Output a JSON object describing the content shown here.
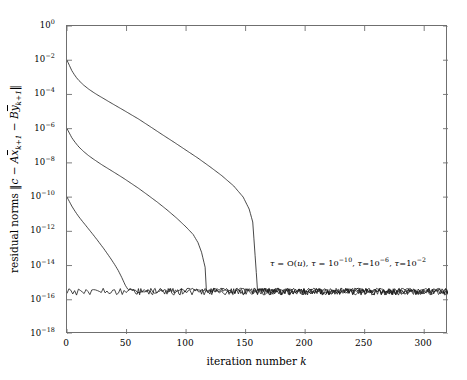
{
  "chart_data": {
    "type": "line",
    "title": "",
    "xlabel": "iteration number k",
    "ylabel": "residual norms ||c - A x̄_{k+1} - B ȳ_{k+1}||",
    "xscale": "linear",
    "yscale": "log",
    "xlim": [
      0,
      320
    ],
    "ylim": [
      1e-18,
      1.0
    ],
    "grid": false,
    "legend_position": "inline-annotation",
    "xticks": [
      0,
      50,
      100,
      150,
      200,
      250,
      300
    ],
    "xticklabels": [
      "0",
      "50",
      "100",
      "150",
      "200",
      "250",
      "300"
    ],
    "yticks": [
      1.0,
      0.01,
      0.0001,
      1e-06,
      1e-08,
      1e-10,
      1e-12,
      1e-14,
      1e-16,
      1e-18
    ],
    "yticklabel_mantissa": "10",
    "yticklabel_exponents": [
      "0",
      "-2",
      "-4",
      "-6",
      "-8",
      "-10",
      "-12",
      "-14",
      "-16",
      "-18"
    ],
    "line_color": "#1a1a1a",
    "line_width": 0.8,
    "noise_floor": 3e-16,
    "annotation": {
      "text": "τ = O(u),  τ = 10^{-10},  τ=10^{-6},  τ=10^{-2}",
      "parts": [
        {
          "tau": "τ",
          "eq": " = O(",
          "var": "u",
          "tail": "),"
        },
        {
          "tau": "τ",
          "eq": " = 10",
          "exp": "-10",
          "tail": ","
        },
        {
          "tau": "τ",
          "eq": "=10",
          "exp": "-6",
          "tail": ","
        },
        {
          "tau": "τ",
          "eq": "=10",
          "exp": "-2",
          "tail": ""
        }
      ],
      "x_data": 205,
      "y_data": 2e-15
    },
    "series": [
      {
        "name": "tau = 10^-2",
        "label": "τ=10⁻²",
        "start_value": 0.01,
        "converge_iteration": 155,
        "points_x": [
          0,
          2,
          4,
          6,
          8,
          10,
          14,
          18,
          22,
          26,
          30,
          36,
          42,
          48,
          54,
          60,
          70,
          80,
          90,
          100,
          110,
          120,
          130,
          140,
          148,
          153,
          156,
          160,
          170,
          185,
          200,
          220,
          240,
          260,
          280,
          300,
          320
        ],
        "points_y": [
          0.01,
          0.005,
          0.0025,
          0.0015,
          0.00095,
          0.00065,
          0.00035,
          0.00021,
          0.000135,
          9e-05,
          6.2e-05,
          3.5e-05,
          2e-05,
          1.15e-05,
          6.5e-06,
          3.7e-06,
          1.3e-06,
          4.5e-07,
          1.6e-07,
          5.5e-08,
          1.9e-08,
          6e-09,
          1.8e-09,
          4.5e-10,
          1e-10,
          2e-11,
          3.5e-12,
          4e-16,
          3.1e-16,
          3e-16,
          3e-16,
          3e-16,
          3e-16,
          3e-16,
          3e-16,
          3e-16,
          3e-16
        ]
      },
      {
        "name": "tau = 10^-6",
        "label": "τ=10⁻⁶",
        "start_value": 1e-06,
        "converge_iteration": 112,
        "points_x": [
          0,
          2,
          4,
          6,
          8,
          10,
          14,
          18,
          22,
          26,
          30,
          36,
          42,
          48,
          54,
          60,
          68,
          76,
          84,
          92,
          100,
          106,
          110,
          113,
          116,
          120,
          130,
          145,
          165,
          190,
          220,
          250,
          280,
          310,
          320
        ],
        "points_y": [
          1e-06,
          5.5e-07,
          3e-07,
          1.9e-07,
          1.25e-07,
          8.5e-08,
          4.6e-08,
          2.7e-08,
          1.7e-08,
          1.1e-08,
          7.2e-09,
          4e-09,
          2.2e-09,
          1.2e-09,
          6.3e-10,
          3.3e-10,
          1.3e-10,
          5e-11,
          1.8e-11,
          6e-12,
          1.8e-12,
          6.5e-13,
          2.2e-13,
          6e-14,
          8e-15,
          3.2e-16,
          3e-16,
          3e-16,
          3e-16,
          3e-16,
          3e-16,
          3e-16,
          3e-16,
          3e-16,
          3e-16
        ]
      },
      {
        "name": "tau = 10^-10",
        "label": "τ=10⁻¹⁰",
        "start_value": 1e-10,
        "converge_iteration": 52,
        "points_x": [
          0,
          2,
          4,
          6,
          8,
          10,
          13,
          16,
          19,
          22,
          25,
          28,
          31,
          34,
          37,
          40,
          43,
          46,
          49,
          51,
          53,
          56,
          62,
          72,
          90,
          115,
          145,
          180,
          215,
          250,
          285,
          320
        ],
        "points_y": [
          1e-10,
          5.5e-11,
          3e-11,
          1.8e-11,
          1.1e-11,
          7e-12,
          3.8e-12,
          2.1e-12,
          1.15e-12,
          6.3e-13,
          3.4e-13,
          1.8e-13,
          9.5e-14,
          4.8e-14,
          2.4e-14,
          1.15e-14,
          5.2e-15,
          2e-15,
          7e-16,
          4.2e-16,
          3.2e-16,
          3e-16,
          3e-16,
          3e-16,
          3e-16,
          3e-16,
          3e-16,
          3e-16,
          3e-16,
          3e-16,
          3e-16,
          3e-16
        ]
      },
      {
        "name": "tau = O(u)",
        "label": "τ = O(u)",
        "start_value": 3e-16,
        "converge_iteration": 0,
        "is_floor": true,
        "points_x": [
          0,
          320
        ],
        "points_y": [
          3e-16,
          3e-16
        ]
      }
    ]
  },
  "axes": {
    "tick_color": "#6f6f6f",
    "frame_color": "#6f6f6f",
    "tick_length": 5
  }
}
